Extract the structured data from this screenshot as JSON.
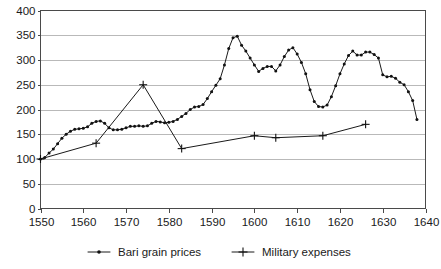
{
  "chart_data": {
    "type": "line",
    "title": "",
    "subtitle": "",
    "xlabel": "",
    "ylabel": "",
    "xlim": [
      1550,
      1640
    ],
    "ylim": [
      0,
      400
    ],
    "grid": true,
    "legend_position": "bottom",
    "y_ticks": [
      0,
      50,
      100,
      150,
      200,
      250,
      300,
      350,
      400
    ],
    "y_tick_labels": [
      "0",
      "50",
      "100",
      "150",
      "200",
      "250",
      "300",
      "350",
      "400"
    ],
    "x_ticks": [
      1550,
      1560,
      1570,
      1580,
      1590,
      1600,
      1610,
      1620,
      1630,
      1640
    ],
    "x_tick_labels": [
      "1550",
      "1560",
      "1570",
      "1580",
      "1590",
      "1600",
      "1610",
      "1620",
      "1630",
      "1640"
    ],
    "series": [
      {
        "name": "Bari grain prices",
        "marker": "dot",
        "color": "#111111",
        "points": [
          [
            1550,
            100
          ],
          [
            1551,
            103
          ],
          [
            1552,
            112
          ],
          [
            1553,
            120
          ],
          [
            1554,
            131
          ],
          [
            1555,
            142
          ],
          [
            1556,
            150
          ],
          [
            1557,
            156
          ],
          [
            1558,
            160
          ],
          [
            1559,
            161
          ],
          [
            1560,
            162
          ],
          [
            1561,
            165
          ],
          [
            1562,
            172
          ],
          [
            1563,
            176
          ],
          [
            1564,
            177
          ],
          [
            1565,
            172
          ],
          [
            1566,
            163
          ],
          [
            1567,
            159
          ],
          [
            1568,
            159
          ],
          [
            1569,
            160
          ],
          [
            1570,
            163
          ],
          [
            1571,
            166
          ],
          [
            1572,
            166
          ],
          [
            1573,
            167
          ],
          [
            1574,
            166
          ],
          [
            1575,
            167
          ],
          [
            1576,
            172
          ],
          [
            1577,
            176
          ],
          [
            1578,
            175
          ],
          [
            1579,
            173
          ],
          [
            1580,
            174
          ],
          [
            1581,
            176
          ],
          [
            1582,
            180
          ],
          [
            1583,
            186
          ],
          [
            1584,
            192
          ],
          [
            1585,
            200
          ],
          [
            1586,
            205
          ],
          [
            1587,
            206
          ],
          [
            1588,
            210
          ],
          [
            1589,
            222
          ],
          [
            1590,
            236
          ],
          [
            1591,
            249
          ],
          [
            1592,
            262
          ],
          [
            1593,
            290
          ],
          [
            1594,
            323
          ],
          [
            1595,
            345
          ],
          [
            1596,
            348
          ],
          [
            1597,
            330
          ],
          [
            1598,
            318
          ],
          [
            1599,
            304
          ],
          [
            1600,
            290
          ],
          [
            1601,
            277
          ],
          [
            1602,
            283
          ],
          [
            1603,
            287
          ],
          [
            1604,
            287
          ],
          [
            1605,
            278
          ],
          [
            1606,
            290
          ],
          [
            1607,
            307
          ],
          [
            1608,
            320
          ],
          [
            1609,
            325
          ],
          [
            1610,
            312
          ],
          [
            1611,
            295
          ],
          [
            1612,
            272
          ],
          [
            1613,
            240
          ],
          [
            1614,
            216
          ],
          [
            1615,
            206
          ],
          [
            1616,
            205
          ],
          [
            1617,
            209
          ],
          [
            1618,
            226
          ],
          [
            1619,
            248
          ],
          [
            1620,
            272
          ],
          [
            1621,
            292
          ],
          [
            1622,
            309
          ],
          [
            1623,
            318
          ],
          [
            1624,
            310
          ],
          [
            1625,
            310
          ],
          [
            1626,
            316
          ],
          [
            1627,
            316
          ],
          [
            1628,
            311
          ],
          [
            1629,
            304
          ],
          [
            1630,
            270
          ],
          [
            1631,
            266
          ],
          [
            1632,
            267
          ],
          [
            1633,
            263
          ],
          [
            1634,
            255
          ],
          [
            1635,
            250
          ],
          [
            1636,
            236
          ],
          [
            1637,
            218
          ],
          [
            1638,
            180
          ]
        ]
      },
      {
        "name": "Military expenses",
        "marker": "plus",
        "color": "#111111",
        "points": [
          [
            1550,
            100
          ],
          [
            1563,
            132
          ],
          [
            1574,
            250
          ],
          [
            1583,
            121
          ],
          [
            1600,
            147
          ],
          [
            1605,
            143
          ],
          [
            1616,
            147
          ],
          [
            1626,
            170
          ]
        ]
      }
    ]
  },
  "legend": {
    "items": [
      {
        "label": "Bari grain prices",
        "marker": "dot"
      },
      {
        "label": "Military expenses",
        "marker": "plus"
      }
    ]
  }
}
